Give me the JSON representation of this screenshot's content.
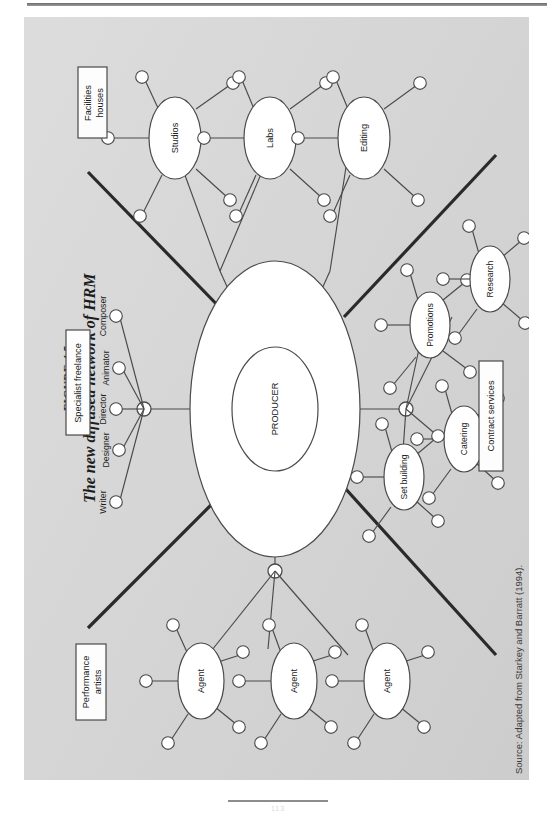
{
  "figure": {
    "number_label": "FIGURE 4.5",
    "title": "The new diffused network of HRM",
    "source": "Source: Adapted from Starkey and Barratt (1994).",
    "page_number": "113"
  },
  "diagram": {
    "center": {
      "core_label": "PRODUCER",
      "outer_shell": true
    },
    "group_boxes": [
      {
        "id": "facilities-houses",
        "label": "Facilities\nhouses",
        "line1": "Facilities",
        "line2": "houses"
      },
      {
        "id": "specialist-freelance",
        "label": "Specialist freelance",
        "line1": "Specialist freelance",
        "line2": ""
      },
      {
        "id": "contract-services",
        "label": "Contract services",
        "line1": "Contract services",
        "line2": ""
      },
      {
        "id": "performance-artists",
        "label": "Performance\nartists",
        "line1": "Performance",
        "line2": "artists"
      }
    ],
    "facility_nodes": [
      {
        "id": "studios",
        "label": "Studios",
        "satellites": 5
      },
      {
        "id": "labs",
        "label": "Labs",
        "satellites": 5
      },
      {
        "id": "editing",
        "label": "Editing",
        "satellites": 5
      }
    ],
    "contract_nodes": [
      {
        "id": "promotions",
        "label": "Promotions",
        "satellites": 5
      },
      {
        "id": "research",
        "label": "Research",
        "satellites": 5
      },
      {
        "id": "catering",
        "label": "Catering",
        "satellites": 5
      },
      {
        "id": "set-building",
        "label": "Set building",
        "satellites": 5
      }
    ],
    "agent_nodes": [
      {
        "id": "agent-1",
        "label": "Agent",
        "satellites": 5
      },
      {
        "id": "agent-2",
        "label": "Agent",
        "satellites": 5
      },
      {
        "id": "agent-3",
        "label": "Agent",
        "satellites": 5
      }
    ],
    "freelance_roles": [
      {
        "id": "composer",
        "label": "Composer"
      },
      {
        "id": "animator",
        "label": "Animator"
      },
      {
        "id": "director",
        "label": "Director"
      },
      {
        "id": "designer",
        "label": "Designer"
      },
      {
        "id": "writer",
        "label": "Writer"
      }
    ],
    "quadrant_dividers": 4
  },
  "colors": {
    "page_background": "#d6d6d6",
    "node_fill": "#ffffff",
    "stroke": "#3c3c3c",
    "divider": "#2a2a2a",
    "text": "#1b1b1b"
  }
}
